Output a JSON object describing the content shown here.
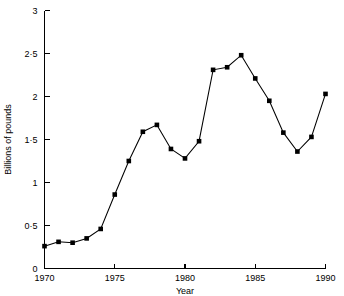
{
  "chart_data": {
    "type": "line",
    "title": "",
    "xlabel": "Year",
    "ylabel": "Billions of pounds",
    "xlim": [
      1970,
      1990
    ],
    "ylim": [
      0,
      3
    ],
    "grid": false,
    "legend": "none",
    "marker": "square",
    "x": [
      1970,
      1971,
      1972,
      1973,
      1974,
      1975,
      1976,
      1977,
      1978,
      1979,
      1980,
      1981,
      1982,
      1983,
      1984,
      1985,
      1986,
      1987,
      1988,
      1989,
      1990
    ],
    "values": [
      0.26,
      0.31,
      0.3,
      0.35,
      0.46,
      0.86,
      1.25,
      1.59,
      1.67,
      1.39,
      1.28,
      1.48,
      2.31,
      2.34,
      2.48,
      2.21,
      1.95,
      1.58,
      1.36,
      1.53,
      2.03
    ],
    "x_ticks": [
      1970,
      1975,
      1980,
      1985,
      1990
    ],
    "x_tick_labels": [
      "1970",
      "1975",
      "1980",
      "1985",
      "1990"
    ],
    "y_ticks": [
      0,
      0.5,
      1,
      1.5,
      2,
      2.5,
      3
    ],
    "y_tick_labels": [
      "0",
      "0·5",
      "1",
      "1·5",
      "2",
      "2·5",
      "3"
    ],
    "line_color": "#000000",
    "marker_color": "#000000",
    "background_color": "#ffffff"
  }
}
